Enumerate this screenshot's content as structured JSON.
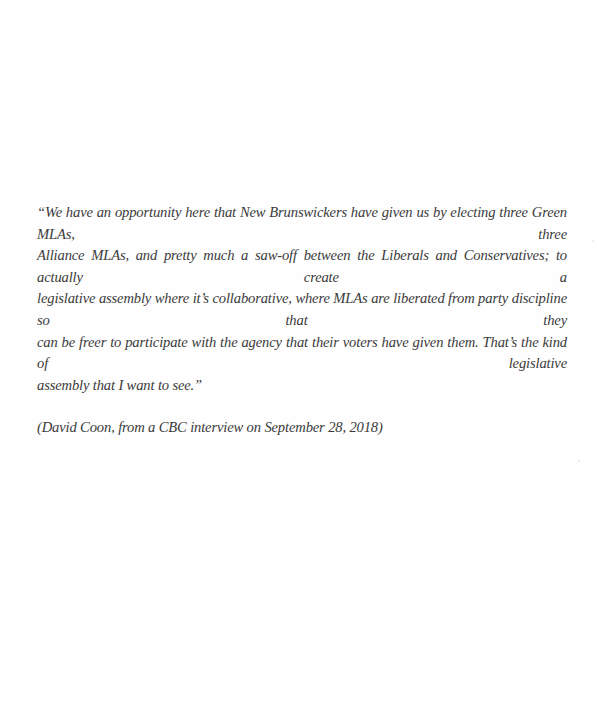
{
  "document": {
    "quote_lines": [
      "“We have an opportunity here that New Brunswickers have given us by electing three Green MLAs, three",
      "Alliance MLAs, and pretty much a saw-off between the Liberals and Conservatives; to actually create a",
      "legislative assembly where it’s collaborative, where MLAs are liberated from party discipline so that they",
      "can be freer to participate with the agency that their voters have given them. That’s the kind of legislative",
      "assembly that I want to see.”"
    ],
    "attribution": "(David Coon, from a CBC interview on September 28, 2018)"
  },
  "colors": {
    "page_background": "#fefefe",
    "text": "#3a3a3a"
  }
}
